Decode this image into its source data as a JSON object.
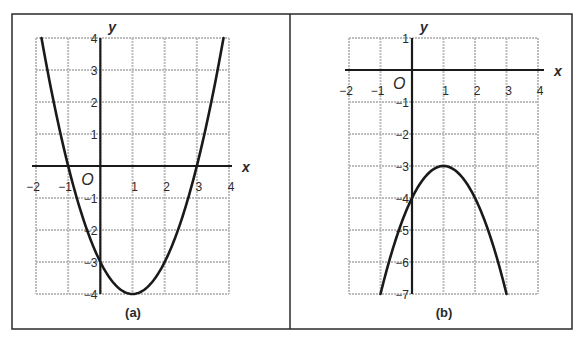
{
  "figure": {
    "panels": [
      "(a)",
      "(b)"
    ]
  },
  "chart_data": [
    {
      "type": "line",
      "title": "(a)",
      "xlabel": "x",
      "ylabel": "y",
      "origin_label": "O",
      "xlim": [
        -2,
        4
      ],
      "ylim": [
        -4,
        4
      ],
      "grid": true,
      "x_ticks": [
        "−2",
        "−1",
        "1",
        "2",
        "3",
        "4"
      ],
      "x_tick_values": [
        -2,
        -1,
        1,
        2,
        3,
        4
      ],
      "y_ticks": [
        "4",
        "3",
        "2",
        "1",
        "−1",
        "−2",
        "−3",
        "−4"
      ],
      "y_tick_values": [
        4,
        3,
        2,
        1,
        -1,
        -2,
        -3,
        -4
      ],
      "series": [
        {
          "name": "parabola",
          "equation": "y = x^2 - 2x - 3",
          "vertex": [
            1,
            -4
          ],
          "x_intercepts": [
            -1,
            3
          ],
          "y_intercept": -3,
          "x_range": [
            -1.83,
            3.83
          ],
          "points": [
            [
              -1.8,
              3.84
            ],
            [
              -1.5,
              2.25
            ],
            [
              -1,
              0
            ],
            [
              -0.5,
              -1.75
            ],
            [
              0,
              -3
            ],
            [
              0.5,
              -3.75
            ],
            [
              1,
              -4
            ],
            [
              1.5,
              -3.75
            ],
            [
              2,
              -3
            ],
            [
              2.5,
              -1.75
            ],
            [
              3,
              0
            ],
            [
              3.5,
              2.25
            ],
            [
              3.8,
              3.84
            ]
          ]
        }
      ]
    },
    {
      "type": "line",
      "title": "(b)",
      "xlabel": "x",
      "ylabel": "y",
      "origin_label": "O",
      "xlim": [
        -2,
        4
      ],
      "ylim": [
        -7,
        1
      ],
      "grid": true,
      "x_ticks": [
        "−2",
        "−1",
        "1",
        "2",
        "3",
        "4"
      ],
      "x_tick_values": [
        -2,
        -1,
        1,
        2,
        3,
        4
      ],
      "y_ticks": [
        "1",
        "−1",
        "−2",
        "−3",
        "−4",
        "−5",
        "−6",
        "−7"
      ],
      "y_tick_values": [
        1,
        -1,
        -2,
        -3,
        -4,
        -5,
        -6,
        -7
      ],
      "series": [
        {
          "name": "parabola",
          "equation": "y = -x^2 + 2x - 4",
          "vertex": [
            1,
            -3
          ],
          "x_intercepts": [],
          "y_intercept": -4,
          "x_range": [
            -1,
            3
          ],
          "points": [
            [
              -1,
              -7
            ],
            [
              -0.5,
              -5.25
            ],
            [
              0,
              -4
            ],
            [
              0.5,
              -3.25
            ],
            [
              1,
              -3
            ],
            [
              1.5,
              -3.25
            ],
            [
              2,
              -4
            ],
            [
              2.5,
              -5.25
            ],
            [
              3,
              -7
            ]
          ]
        }
      ]
    }
  ],
  "style": {
    "curve_color": "#1a1a1a",
    "axis_color": "#1a1a1a",
    "grid_color": "#bdbdbd",
    "border_color": "#2a2a2a"
  }
}
